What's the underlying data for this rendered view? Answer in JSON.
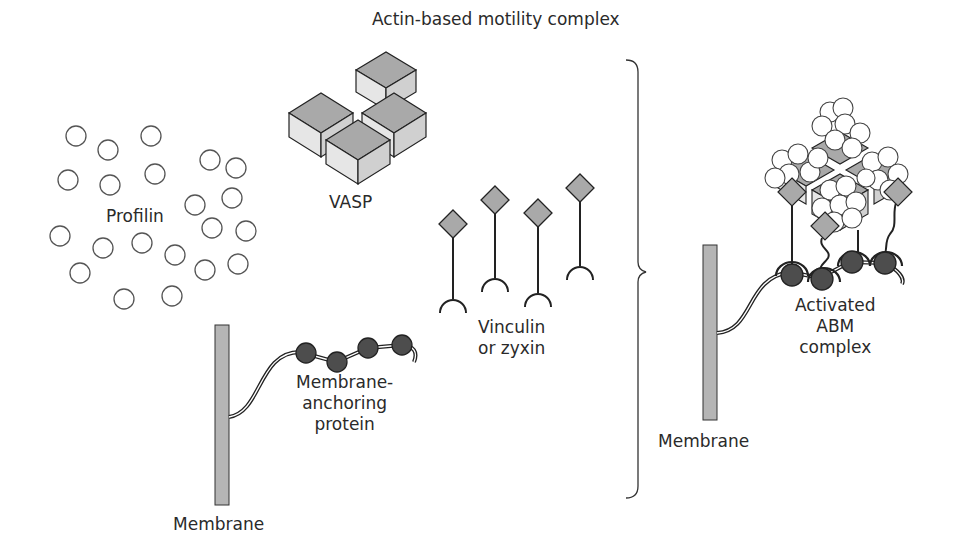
{
  "title": "Actin-based motility complex",
  "labels": {
    "profilin": "Profilin",
    "vasp": "VASP",
    "vinculin": [
      "Vinculin",
      "or zyxin"
    ],
    "anchoring": [
      "Membrane-",
      "anchoring",
      "protein"
    ],
    "membrane_left": "Membrane",
    "membrane_right": "Membrane",
    "activated": [
      "Activated",
      "ABM",
      "complex"
    ]
  },
  "colors": {
    "line": "#222222",
    "gray_fill": "#a9a9a9",
    "light_fill": "#e6e6e6",
    "dark_bead": "#4d4d4d",
    "membrane": "#b5b5b5"
  },
  "profilin_circles": [
    [
      76,
      136
    ],
    [
      108,
      150
    ],
    [
      151,
      136
    ],
    [
      68,
      180
    ],
    [
      110,
      185
    ],
    [
      155,
      174
    ],
    [
      210,
      160
    ],
    [
      236,
      168
    ],
    [
      195,
      205
    ],
    [
      232,
      198
    ],
    [
      212,
      228
    ],
    [
      246,
      231
    ],
    [
      60,
      236
    ],
    [
      103,
      248
    ],
    [
      142,
      243
    ],
    [
      175,
      255
    ],
    [
      80,
      273
    ],
    [
      205,
      270
    ],
    [
      238,
      264
    ],
    [
      124,
      299
    ],
    [
      172,
      296
    ]
  ]
}
